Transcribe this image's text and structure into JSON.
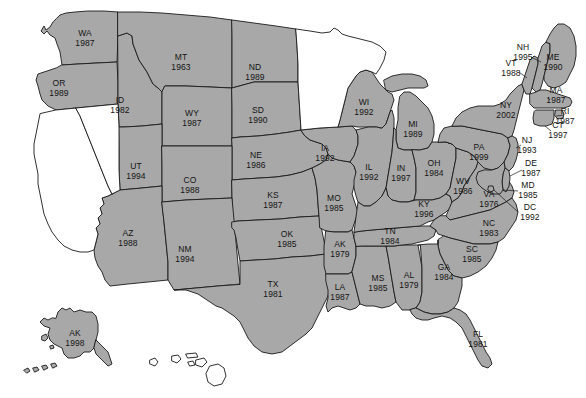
{
  "figure": {
    "name": "us-states-choropleth-year-map",
    "width": 586,
    "height": 398,
    "background_color": "#ffffff",
    "filled_color": "#a8a8a8",
    "unfilled_color": "#ffffff",
    "border_color": "#1a1a1a",
    "label_color": "#141414"
  },
  "states": [
    {
      "abbr": "WA",
      "year": "1987",
      "filled": true,
      "lx": 85,
      "ly": 38
    },
    {
      "abbr": "OR",
      "year": "1989",
      "filled": true,
      "lx": 59,
      "ly": 88
    },
    {
      "abbr": "ID",
      "year": "1982",
      "filled": true,
      "lx": 120,
      "ly": 105
    },
    {
      "abbr": "MT",
      "year": "1963",
      "filled": true,
      "lx": 181,
      "ly": 62
    },
    {
      "abbr": "WY",
      "year": "1987",
      "filled": true,
      "lx": 192,
      "ly": 118
    },
    {
      "abbr": "ND",
      "year": "1989",
      "filled": true,
      "lx": 255,
      "ly": 72
    },
    {
      "abbr": "SD",
      "year": "1990",
      "filled": true,
      "lx": 258,
      "ly": 115
    },
    {
      "abbr": "NE",
      "year": "1986",
      "filled": true,
      "lx": 256,
      "ly": 160
    },
    {
      "abbr": "UT",
      "year": "1994",
      "filled": true,
      "lx": 136,
      "ly": 171
    },
    {
      "abbr": "CO",
      "year": "1988",
      "filled": true,
      "lx": 190,
      "ly": 185
    },
    {
      "abbr": "KS",
      "year": "1987",
      "filled": true,
      "lx": 273,
      "ly": 200
    },
    {
      "abbr": "AZ",
      "year": "1988",
      "filled": true,
      "lx": 128,
      "ly": 238
    },
    {
      "abbr": "NM",
      "year": "1994",
      "filled": true,
      "lx": 185,
      "ly": 254
    },
    {
      "abbr": "OK",
      "year": "1985",
      "filled": true,
      "lx": 287,
      "ly": 239
    },
    {
      "abbr": "TX",
      "year": "1981",
      "filled": true,
      "lx": 273,
      "ly": 289
    },
    {
      "abbr": "MO",
      "year": "1985",
      "filled": true,
      "lx": 334,
      "ly": 203
    },
    {
      "abbr": "IA",
      "year": "1992",
      "filled": true,
      "lx": 325,
      "ly": 153
    },
    {
      "abbr": "WI",
      "year": "1992",
      "filled": true,
      "lx": 364,
      "ly": 107
    },
    {
      "abbr": "MI",
      "year": "1989",
      "filled": true,
      "lx": 413,
      "ly": 129
    },
    {
      "abbr": "IL",
      "year": "1992",
      "filled": true,
      "lx": 369,
      "ly": 172
    },
    {
      "abbr": "IN",
      "year": "1997",
      "filled": true,
      "lx": 401,
      "ly": 173
    },
    {
      "abbr": "OH",
      "year": "1984",
      "filled": true,
      "lx": 434,
      "ly": 168
    },
    {
      "abbr": "AK",
      "year": "1979",
      "filled": true,
      "lx": 340,
      "ly": 249
    },
    {
      "abbr": "LA",
      "year": "1987",
      "filled": true,
      "lx": 340,
      "ly": 292
    },
    {
      "abbr": "MS",
      "year": "1985",
      "filled": true,
      "lx": 378,
      "ly": 283
    },
    {
      "abbr": "AL",
      "year": "1979",
      "filled": true,
      "lx": 409,
      "ly": 280
    },
    {
      "abbr": "TN",
      "year": "1984",
      "filled": true,
      "lx": 390,
      "ly": 236
    },
    {
      "abbr": "KY",
      "year": "1996",
      "filled": true,
      "lx": 424,
      "ly": 209
    },
    {
      "abbr": "WV",
      "year": "1986",
      "filled": true,
      "lx": 463,
      "ly": 186
    },
    {
      "abbr": "VA",
      "year": "1976",
      "filled": true,
      "lx": 489,
      "ly": 199
    },
    {
      "abbr": "NC",
      "year": "1983",
      "filled": true,
      "lx": 489,
      "ly": 228
    },
    {
      "abbr": "SC",
      "year": "1985",
      "filled": true,
      "lx": 472,
      "ly": 254
    },
    {
      "abbr": "GA",
      "year": "1984",
      "filled": true,
      "lx": 444,
      "ly": 272
    },
    {
      "abbr": "FL",
      "year": "1981",
      "filled": true,
      "lx": 478,
      "ly": 339
    },
    {
      "abbr": "PA",
      "year": "1999",
      "filled": true,
      "lx": 479,
      "ly": 152
    },
    {
      "abbr": "NY",
      "year": "2002",
      "filled": true,
      "lx": 506,
      "ly": 110
    },
    {
      "abbr": "VT",
      "year": "1988",
      "filled": true,
      "lx": 511,
      "ly": 68
    },
    {
      "abbr": "NH",
      "year": "1995",
      "filled": true,
      "lx": 523,
      "ly": 52
    },
    {
      "abbr": "ME",
      "year": "1990",
      "filled": true,
      "lx": 553,
      "ly": 62
    },
    {
      "abbr": "MA",
      "year": "1987",
      "filled": true,
      "lx": 556,
      "ly": 95
    },
    {
      "abbr": "RI",
      "year": "1987",
      "filled": true,
      "lx": 565,
      "ly": 116
    },
    {
      "abbr": "CT",
      "year": "1997",
      "filled": true,
      "lx": 558,
      "ly": 130
    },
    {
      "abbr": "NJ",
      "year": "1993",
      "filled": true,
      "lx": 527,
      "ly": 145
    },
    {
      "abbr": "DE",
      "year": "1987",
      "filled": true,
      "lx": 531,
      "ly": 168
    },
    {
      "abbr": "MD",
      "year": "1985",
      "filled": true,
      "lx": 528,
      "ly": 190
    },
    {
      "abbr": "DC",
      "year": "1992",
      "filled": true,
      "lx": 530,
      "ly": 212
    },
    {
      "abbr": "AK",
      "year": "1998",
      "filled": true,
      "lx": 75,
      "ly": 338
    }
  ],
  "unlabeled_states": [
    {
      "name": "California",
      "filled": false
    },
    {
      "name": "Nevada",
      "filled": false
    },
    {
      "name": "Minnesota",
      "filled": false
    },
    {
      "name": "Hawaii",
      "filled": false
    }
  ]
}
